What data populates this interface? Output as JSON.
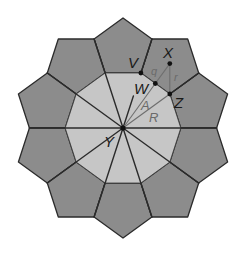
{
  "figure": {
    "colors": {
      "background": "#ffffff",
      "pentagon_fill": "#8c8c8c",
      "decagon_fill": "#c6c6c6",
      "edge_stroke": "#2b2b2b",
      "measure_stroke": "#6e6e6e",
      "point_fill": "#111111",
      "label_dark": "#1a1a1a",
      "label_gray": "#6a6a6a"
    },
    "labels": {
      "V": "V",
      "W": "W",
      "X": "X",
      "Z": "Z",
      "Y": "Y",
      "A": "A",
      "R": "R",
      "q": "q",
      "r": "r"
    },
    "points": {
      "Y": {
        "name": "Y",
        "role": "center of decagon"
      },
      "V": {
        "name": "V",
        "role": "decagon vertex"
      },
      "W": {
        "name": "W",
        "role": "midpoint of decagon edge"
      },
      "Z": {
        "name": "Z",
        "role": "decagon vertex"
      },
      "X": {
        "name": "X",
        "role": "center of pentagon"
      }
    },
    "segments": [
      {
        "from": "Y",
        "to": "W",
        "label": "A",
        "meaning": "apothem of decagon"
      },
      {
        "from": "Y",
        "to": "Z",
        "label": "R",
        "meaning": "radius of decagon"
      },
      {
        "from": "W",
        "to": "X",
        "label": "q",
        "meaning": "apothem of pentagon"
      },
      {
        "from": "X",
        "to": "Z",
        "label": "r",
        "meaning": "radius of pentagon"
      }
    ],
    "shape_counts": {
      "pentagons": 10,
      "decagons": 1
    }
  }
}
